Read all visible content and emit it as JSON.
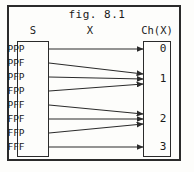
{
  "figure": {
    "title": "fig. 8.1",
    "frame": {
      "x": 7,
      "y": 5,
      "width": 174,
      "height": 156
    }
  },
  "headers": {
    "domain": "S",
    "function": "X",
    "codomain": "Ch(X)"
  },
  "domain_box": {
    "x": 17,
    "y": 41,
    "width": 32,
    "height": 116,
    "items": [
      {
        "label": "PPP",
        "y": 49
      },
      {
        "label": "PPF",
        "y": 63
      },
      {
        "label": "PFP",
        "y": 77
      },
      {
        "label": "FPP",
        "y": 91
      },
      {
        "label": "PFF",
        "y": 105
      },
      {
        "label": "FPF",
        "y": 119
      },
      {
        "label": "FFP",
        "y": 133
      },
      {
        "label": "FFF",
        "y": 147
      }
    ]
  },
  "codomain_box": {
    "x": 143,
    "y": 41,
    "width": 28,
    "height": 116,
    "items": [
      {
        "label": "0",
        "y": 49
      },
      {
        "label": "1",
        "y": 79
      },
      {
        "label": "2",
        "y": 119
      },
      {
        "label": "3",
        "y": 147
      }
    ]
  },
  "mappings": [
    {
      "from": "PPP",
      "to": "0",
      "x1": 49,
      "y1": 49,
      "x2": 143,
      "y2": 49
    },
    {
      "from": "PPF",
      "to": "1",
      "x1": 49,
      "y1": 63,
      "x2": 143,
      "y2": 74
    },
    {
      "from": "PFP",
      "to": "1",
      "x1": 49,
      "y1": 77,
      "x2": 143,
      "y2": 79
    },
    {
      "from": "FPP",
      "to": "1",
      "x1": 49,
      "y1": 91,
      "x2": 143,
      "y2": 84
    },
    {
      "from": "PFF",
      "to": "2",
      "x1": 49,
      "y1": 105,
      "x2": 143,
      "y2": 114
    },
    {
      "from": "FPF",
      "to": "2",
      "x1": 49,
      "y1": 119,
      "x2": 143,
      "y2": 119
    },
    {
      "from": "FFP",
      "to": "2",
      "x1": 49,
      "y1": 133,
      "x2": 143,
      "y2": 124
    },
    {
      "from": "FFF",
      "to": "3",
      "x1": 49,
      "y1": 147,
      "x2": 143,
      "y2": 147
    }
  ],
  "colors": {
    "ink": "#1a1a1a",
    "line": "#2b2b2b",
    "background": "#fdfdfb"
  }
}
